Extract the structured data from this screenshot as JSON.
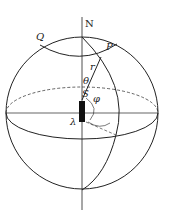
{
  "diagram": {
    "type": "celestial-sphere",
    "labels": {
      "north": "N",
      "point_p": "P",
      "point_q": "Q",
      "radius": "r",
      "theta": "θ",
      "phi": "φ",
      "lambda": "λ",
      "south": "S"
    },
    "colors": {
      "stroke": "#222222",
      "object": "#111111",
      "background": "#ffffff"
    }
  }
}
